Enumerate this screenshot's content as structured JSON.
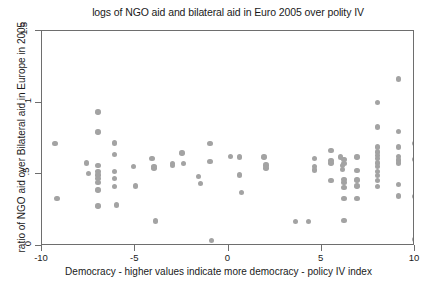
{
  "chart_data": {
    "type": "scatter",
    "title": "logs of NGO aid and bilateral aid in Euro 2005 over polity IV",
    "xlabel": "Democracy - higher values indicate more democracy - policy IV index",
    "ylabel": "ratio of NGO aid over Bilateral aid in Europe in 2005",
    "xlim": [
      -10,
      10
    ],
    "ylim": [
      0,
      1.5
    ],
    "xticks": [
      -10,
      -5,
      0,
      5,
      10
    ],
    "xtick_labels": [
      "-10",
      "-5",
      "0",
      "5",
      "10"
    ],
    "yticks": [
      0,
      0.5,
      1,
      1.5
    ],
    "ytick_labels": [
      "0",
      ".5",
      "1",
      "1.5"
    ],
    "grid": false,
    "legend": null,
    "marker": {
      "shape": "circle",
      "color": "#a3a3a3",
      "size_px": 5.4
    },
    "points": [
      [
        -9.3,
        0.715
      ],
      [
        -9.2,
        0.33
      ],
      [
        -7.6,
        0.58
      ],
      [
        -7.5,
        0.505
      ],
      [
        -7.0,
        0.935
      ],
      [
        -7.0,
        0.795
      ],
      [
        -7.0,
        0.56
      ],
      [
        -7.0,
        0.52
      ],
      [
        -7.0,
        0.495
      ],
      [
        -7.0,
        0.47
      ],
      [
        -7.0,
        0.445
      ],
      [
        -7.0,
        0.39
      ],
      [
        -7.0,
        0.28
      ],
      [
        -6.1,
        0.72
      ],
      [
        -6.1,
        0.64
      ],
      [
        -6.1,
        0.52
      ],
      [
        -6.1,
        0.47
      ],
      [
        -6.1,
        0.415
      ],
      [
        -6.0,
        0.285
      ],
      [
        -5.1,
        0.555
      ],
      [
        -5.0,
        0.42
      ],
      [
        -4.1,
        0.61
      ],
      [
        -4.0,
        0.555
      ],
      [
        -4.0,
        0.545
      ],
      [
        -3.9,
        0.175
      ],
      [
        -3.0,
        0.575
      ],
      [
        -3.0,
        0.56
      ],
      [
        -2.5,
        0.65
      ],
      [
        -2.4,
        0.575
      ],
      [
        -1.6,
        0.485
      ],
      [
        -1.5,
        0.435
      ],
      [
        -1.0,
        0.715
      ],
      [
        -1.0,
        0.59
      ],
      [
        -0.9,
        0.04
      ],
      [
        0.1,
        0.625
      ],
      [
        0.6,
        0.62
      ],
      [
        0.6,
        0.495
      ],
      [
        0.7,
        0.375
      ],
      [
        1.9,
        0.62
      ],
      [
        2.0,
        0.565
      ],
      [
        2.0,
        0.545
      ],
      [
        3.6,
        0.17
      ],
      [
        4.3,
        0.17
      ],
      [
        4.6,
        0.61
      ],
      [
        4.6,
        0.555
      ],
      [
        4.6,
        0.53
      ],
      [
        5.5,
        0.665
      ],
      [
        5.5,
        0.595
      ],
      [
        5.5,
        0.58
      ],
      [
        5.5,
        0.455
      ],
      [
        6.0,
        0.62
      ],
      [
        6.1,
        0.56
      ],
      [
        6.1,
        0.535
      ],
      [
        6.2,
        0.605
      ],
      [
        6.2,
        0.575
      ],
      [
        6.2,
        0.465
      ],
      [
        6.2,
        0.445
      ],
      [
        6.2,
        0.41
      ],
      [
        6.2,
        0.33
      ],
      [
        6.2,
        0.18
      ],
      [
        6.9,
        0.62
      ],
      [
        6.9,
        0.525
      ],
      [
        6.9,
        0.46
      ],
      [
        6.9,
        0.42
      ],
      [
        6.9,
        0.33
      ],
      [
        8.0,
        1.0
      ],
      [
        8.0,
        0.83
      ],
      [
        8.0,
        0.69
      ],
      [
        8.0,
        0.655
      ],
      [
        8.0,
        0.63
      ],
      [
        8.0,
        0.61
      ],
      [
        8.0,
        0.58
      ],
      [
        8.0,
        0.555
      ],
      [
        8.0,
        0.52
      ],
      [
        8.0,
        0.49
      ],
      [
        8.0,
        0.455
      ],
      [
        8.0,
        0.415
      ],
      [
        9.1,
        1.165
      ],
      [
        9.1,
        0.8
      ],
      [
        9.1,
        0.69
      ],
      [
        9.1,
        0.625
      ],
      [
        9.1,
        0.6
      ],
      [
        9.1,
        0.58
      ],
      [
        9.1,
        0.43
      ],
      [
        9.1,
        0.35
      ],
      [
        10.0,
        0.715
      ],
      [
        10.0,
        0.605
      ],
      [
        10.0,
        0.345
      ],
      [
        10.0,
        0.045
      ]
    ]
  },
  "colors": {
    "marker": "#a3a3a3",
    "frame": "#6e6e6e",
    "text": "#1a1a1a",
    "background": "#ffffff"
  }
}
